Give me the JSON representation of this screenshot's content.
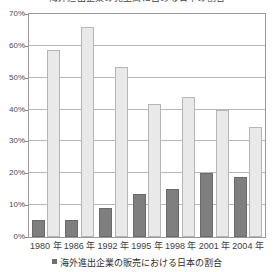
{
  "title": "海外進出企業の売上高に占める日本の割合",
  "legend": {
    "swatch_name": "legend-swatch-dark",
    "label": "海外進出企業の販売における日本の割合"
  },
  "axis": {
    "y_ticks": [
      "0%",
      "10%",
      "20%",
      "30%",
      "40%",
      "50%",
      "60%",
      "70%"
    ],
    "x_ticks": [
      "1980 年",
      "1986 年",
      "1992 年",
      "1995 年",
      "1998 年",
      "2001 年",
      "2004 年"
    ]
  },
  "colors": {
    "series_dark": "#7f7f7f",
    "series_light": "#e9e9e9",
    "grid": "#b8b8b8",
    "frame": "#9a9a9a",
    "text": "#3d3d3d"
  },
  "chart_data": {
    "type": "bar",
    "title": "海外進出企業の売上高に占める日本の割合",
    "xlabel": "",
    "ylabel": "",
    "ylim": [
      0,
      70
    ],
    "ytick_step": 10,
    "ytick_suffix": "%",
    "grid": true,
    "legend_position": "bottom",
    "categories": [
      "1980 年",
      "1986 年",
      "1992 年",
      "1995 年",
      "1998 年",
      "2001 年",
      "2004 年"
    ],
    "series": [
      {
        "name": "海外進出企業の販売における日本の割合",
        "color": "#7f7f7f",
        "values": [
          5.3,
          5.3,
          9.2,
          13.5,
          15.2,
          20.2,
          18.8
        ]
      },
      {
        "name": "",
        "color": "#e9e9e9",
        "values": [
          58.6,
          66.0,
          53.4,
          41.8,
          43.8,
          39.8,
          34.4
        ]
      }
    ]
  }
}
